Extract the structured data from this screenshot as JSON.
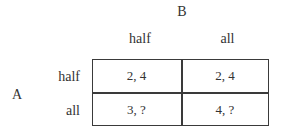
{
  "diagram": {
    "type": "payoff-matrix",
    "column_player": {
      "label": "B",
      "strategies": [
        "half",
        "all"
      ]
    },
    "row_player": {
      "label": "A",
      "strategies": [
        "half",
        "all"
      ]
    },
    "cells": [
      [
        {
          "text": "2, 4"
        },
        {
          "text": "2, 4"
        }
      ],
      [
        {
          "text": "3, ?"
        },
        {
          "text": "4, ?"
        }
      ]
    ],
    "colors": {
      "text": "#333333",
      "grid_line": "#3a3a3a",
      "background": "#ffffff"
    }
  }
}
